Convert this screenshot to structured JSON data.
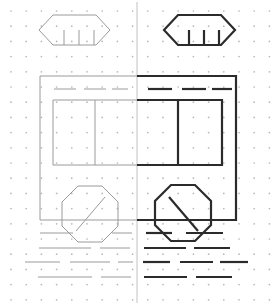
{
  "figure": {
    "width": 272,
    "height": 305,
    "background_color": "#ffffff"
  },
  "grid": {
    "name": "dot-lattice",
    "dot_color": "#b8b8b8",
    "dot_radius": 0.85,
    "spacing_x": 15.2,
    "spacing_y": 15.2,
    "origin_x": 11,
    "origin_y": 11,
    "columns": 18,
    "rows": 20
  },
  "divider": {
    "name": "center-axis",
    "x": 137,
    "y1": 2,
    "y2": 303,
    "color": "#c2c2c2",
    "width": 1
  },
  "styles": {
    "faint": {
      "color": "#9a9a9a",
      "width": 1.0
    },
    "bold": {
      "color": "#2b2b2b",
      "width": 2.2
    }
  },
  "chart_data": {
    "type": "line",
    "xlabel": "",
    "ylabel": "",
    "xlim": [
      0,
      272
    ],
    "ylim": [
      0,
      305
    ],
    "grid": "dots",
    "legend": "none",
    "series": [
      {
        "name": "left-half-faint",
        "style": "faint",
        "shapes": [
          {
            "name": "roof-sign-left",
            "type": "polygon",
            "closed": true,
            "points": [
              [
                53,
                15
              ],
              [
                96,
                15
              ],
              [
                110,
                30
              ],
              [
                96,
                45
              ],
              [
                53,
                45
              ],
              [
                39,
                30
              ]
            ]
          },
          {
            "name": "roof-sign-left-tick-1",
            "type": "polyline",
            "points": [
              [
                64,
                30
              ],
              [
                64,
                45
              ]
            ]
          },
          {
            "name": "roof-sign-left-tick-2",
            "type": "polyline",
            "points": [
              [
                79,
                30
              ],
              [
                79,
                45
              ]
            ]
          },
          {
            "name": "roof-sign-left-tick-3",
            "type": "polyline",
            "points": [
              [
                94,
                30
              ],
              [
                94,
                45
              ]
            ]
          },
          {
            "name": "body-outline-left",
            "type": "polyline",
            "points": [
              [
                137,
                76
              ],
              [
                40,
                76
              ],
              [
                40,
                220
              ],
              [
                137,
                220
              ]
            ]
          },
          {
            "name": "window-strip-dash-1",
            "type": "polyline",
            "points": [
              [
                54,
                89
              ],
              [
                76,
                89
              ]
            ]
          },
          {
            "name": "window-strip-dash-2",
            "type": "polyline",
            "points": [
              [
                84,
                89
              ],
              [
                106,
                89
              ]
            ]
          },
          {
            "name": "window-strip-dash-3",
            "type": "polyline",
            "points": [
              [
                112,
                89
              ],
              [
                128,
                89
              ]
            ]
          },
          {
            "name": "window-box-left",
            "type": "polyline",
            "points": [
              [
                137,
                100
              ],
              [
                53,
                100
              ],
              [
                53,
                165
              ],
              [
                137,
                165
              ]
            ]
          },
          {
            "name": "window-mullion-left",
            "type": "polyline",
            "points": [
              [
                95,
                100
              ],
              [
                95,
                165
              ]
            ]
          },
          {
            "name": "wheel-left",
            "type": "polygon",
            "closed": true,
            "points": [
              [
                78,
                186
              ],
              [
                102,
                186
              ],
              [
                118,
                202
              ],
              [
                118,
                226
              ],
              [
                102,
                242
              ],
              [
                78,
                242
              ],
              [
                62,
                226
              ],
              [
                62,
                202
              ]
            ]
          },
          {
            "name": "wheel-left-spoke",
            "type": "polyline",
            "points": [
              [
                76,
                231
              ],
              [
                105,
                197
              ]
            ]
          },
          {
            "name": "road-row1-dash-1",
            "type": "polyline",
            "points": [
              [
                40,
                233
              ],
              [
                73,
                233
              ]
            ]
          },
          {
            "name": "road-row1-dash-2",
            "type": "polyline",
            "points": [
              [
                112,
                233
              ],
              [
                132,
                233
              ]
            ]
          },
          {
            "name": "road-row2-dash-1",
            "type": "polyline",
            "points": [
              [
                39,
                248
              ],
              [
                91,
                248
              ]
            ]
          },
          {
            "name": "road-row2-dash-2",
            "type": "polyline",
            "points": [
              [
                100,
                248
              ],
              [
                130,
                248
              ]
            ]
          },
          {
            "name": "road-row3-dash-1",
            "type": "polyline",
            "points": [
              [
                25,
                262
              ],
              [
                60,
                262
              ]
            ]
          },
          {
            "name": "road-row3-dash-2",
            "type": "polyline",
            "points": [
              [
                70,
                262
              ],
              [
                110,
                262
              ]
            ]
          },
          {
            "name": "road-row3-dash-3",
            "type": "polyline",
            "points": [
              [
                118,
                262
              ],
              [
                133,
                262
              ]
            ]
          },
          {
            "name": "road-row4-dash-1",
            "type": "polyline",
            "points": [
              [
                38,
                277
              ],
              [
                92,
                277
              ]
            ]
          },
          {
            "name": "road-row4-dash-2",
            "type": "polyline",
            "points": [
              [
                101,
                277
              ],
              [
                131,
                277
              ]
            ]
          }
        ]
      },
      {
        "name": "right-half-bold",
        "style": "bold",
        "shapes": [
          {
            "name": "roof-sign-right",
            "type": "polygon",
            "closed": true,
            "points": [
              [
                178,
                15
              ],
              [
                221,
                15
              ],
              [
                235,
                30
              ],
              [
                221,
                45
              ],
              [
                178,
                45
              ],
              [
                164,
                30
              ]
            ]
          },
          {
            "name": "roof-sign-right-tick-1",
            "type": "polyline",
            "points": [
              [
                189,
                30
              ],
              [
                189,
                45
              ]
            ]
          },
          {
            "name": "roof-sign-right-tick-2",
            "type": "polyline",
            "points": [
              [
                204,
                30
              ],
              [
                204,
                45
              ]
            ]
          },
          {
            "name": "roof-sign-right-tick-3",
            "type": "polyline",
            "points": [
              [
                219,
                30
              ],
              [
                219,
                45
              ]
            ]
          },
          {
            "name": "body-outline-right",
            "type": "polyline",
            "points": [
              [
                137,
                76
              ],
              [
                236,
                76
              ],
              [
                236,
                220
              ],
              [
                137,
                220
              ]
            ]
          },
          {
            "name": "window-strip-dash-4",
            "type": "polyline",
            "points": [
              [
                148,
                89
              ],
              [
                172,
                89
              ]
            ]
          },
          {
            "name": "window-strip-dash-5",
            "type": "polyline",
            "points": [
              [
                182,
                89
              ],
              [
                206,
                89
              ]
            ]
          },
          {
            "name": "window-strip-dash-6",
            "type": "polyline",
            "points": [
              [
                212,
                89
              ],
              [
                232,
                89
              ]
            ]
          },
          {
            "name": "window-box-right",
            "type": "polyline",
            "points": [
              [
                137,
                100
              ],
              [
                222,
                100
              ],
              [
                222,
                165
              ],
              [
                137,
                165
              ]
            ]
          },
          {
            "name": "window-mullion-right",
            "type": "polyline",
            "points": [
              [
                178,
                100
              ],
              [
                178,
                165
              ]
            ]
          },
          {
            "name": "wheel-right",
            "type": "polygon",
            "closed": true,
            "points": [
              [
                171,
                185
              ],
              [
                195,
                185
              ],
              [
                211,
                201
              ],
              [
                211,
                225
              ],
              [
                195,
                241
              ],
              [
                171,
                241
              ],
              [
                155,
                225
              ],
              [
                155,
                201
              ]
            ]
          },
          {
            "name": "wheel-right-spoke",
            "type": "polyline",
            "points": [
              [
                169,
                197
              ],
              [
                198,
                231
              ]
            ]
          },
          {
            "name": "road-row1-dash-3",
            "type": "polyline",
            "points": [
              [
                146,
                233
              ],
              [
                172,
                233
              ]
            ]
          },
          {
            "name": "road-row1-dash-4",
            "type": "polyline",
            "points": [
              [
                186,
                233
              ],
              [
                223,
                233
              ]
            ]
          },
          {
            "name": "road-row2-dash-3",
            "type": "polyline",
            "points": [
              [
                144,
                248
              ],
              [
                186,
                248
              ]
            ]
          },
          {
            "name": "road-row2-dash-4",
            "type": "polyline",
            "points": [
              [
                194,
                248
              ],
              [
                230,
                248
              ]
            ]
          },
          {
            "name": "road-row3-dash-4",
            "type": "polyline",
            "points": [
              [
                143,
                262
              ],
              [
                170,
                262
              ]
            ]
          },
          {
            "name": "road-row3-dash-5",
            "type": "polyline",
            "points": [
              [
                180,
                262
              ],
              [
                213,
                262
              ]
            ]
          },
          {
            "name": "road-row3-dash-6",
            "type": "polyline",
            "points": [
              [
                220,
                262
              ],
              [
                248,
                262
              ]
            ]
          },
          {
            "name": "road-row4-dash-3",
            "type": "polyline",
            "points": [
              [
                144,
                277
              ],
              [
                187,
                277
              ]
            ]
          },
          {
            "name": "road-row4-dash-4",
            "type": "polyline",
            "points": [
              [
                196,
                277
              ],
              [
                232,
                277
              ]
            ]
          }
        ]
      }
    ]
  }
}
